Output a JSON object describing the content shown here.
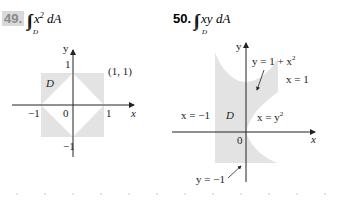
{
  "problems": [
    {
      "number": "49.",
      "integrand": "x",
      "exponent": "2",
      "differential": "dA",
      "region": "D",
      "figure": {
        "axis_x": "x",
        "axis_y": "y",
        "ticks": {
          "x_neg": "−1",
          "x_pos": "1",
          "origin": "0",
          "y_pos": "1",
          "y_neg": "−1"
        },
        "point_label": "(1, 1)",
        "region_label": "D"
      }
    },
    {
      "number": "50.",
      "integrand": "xy",
      "differential": "dA",
      "region": "D",
      "figure": {
        "axis_x": "x",
        "axis_y": "y",
        "origin": "0",
        "region_label": "D",
        "labels": {
          "top_curve_lhs": "y = 1 + x",
          "top_curve_exp": "2",
          "right_line": "x = 1",
          "left_line": "x = −1",
          "parabola_lhs": "x = y",
          "parabola_exp": "2",
          "bottom_line": "y = −1"
        }
      }
    }
  ],
  "colors": {
    "shade": "#e3e3e3",
    "axis": "#222222",
    "badge_bg": "#d9d9d9",
    "badge_text": "#8a8a8a"
  }
}
